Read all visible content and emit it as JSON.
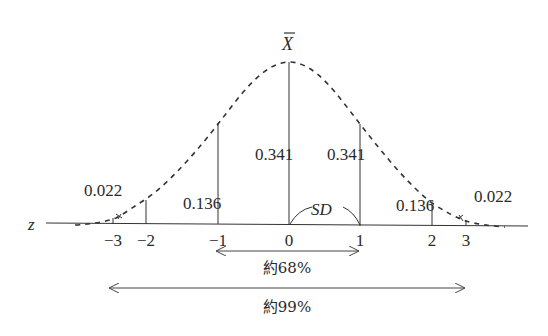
{
  "figure": {
    "mean_label": "X̄",
    "axis_label": "z",
    "sd_label": "SD",
    "ticks": [
      {
        "label": "−3",
        "x": 113
      },
      {
        "label": "−2",
        "x": 146
      },
      {
        "label": "−1",
        "x": 218
      },
      {
        "label": "0",
        "x": 289
      },
      {
        "label": "1",
        "x": 360
      },
      {
        "label": "2",
        "x": 432
      },
      {
        "label": "3",
        "x": 466
      }
    ],
    "area_labels": [
      {
        "name": "area-minus3-minus2",
        "text": "0.022",
        "x": 84,
        "y": 196
      },
      {
        "name": "area-minus2-minus1",
        "text": "0.136",
        "x": 183,
        "y": 209
      },
      {
        "name": "area-minus1-0",
        "text": "0.341",
        "x": 255,
        "y": 160
      },
      {
        "name": "area-0-1",
        "text": "0.341",
        "x": 327,
        "y": 160
      },
      {
        "name": "area-1-2",
        "text": "0.136",
        "x": 396,
        "y": 211
      },
      {
        "name": "area-2-3",
        "text": "0.022",
        "x": 474,
        "y": 202
      }
    ],
    "ranges": [
      {
        "name": "range-68",
        "text": "約68%",
        "x1": 215,
        "x2": 360,
        "y": 251,
        "label_y": 273
      },
      {
        "name": "range-99",
        "text": "約99%",
        "x1": 108,
        "x2": 466,
        "y": 288,
        "label_y": 312
      }
    ]
  }
}
